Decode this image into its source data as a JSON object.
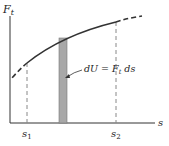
{
  "diagram": {
    "y_axis_label": "F",
    "y_axis_label_sub": "t",
    "x_axis_label": "s",
    "s1_label": "s",
    "s1_sub": "1",
    "s2_label": "s",
    "s2_sub": "2",
    "strip_label_main": "dU = F",
    "strip_label_sub": "t",
    "strip_label_tail": " ds",
    "colors": {
      "curve": "#333333",
      "strip": "#999999",
      "axis": "#333333"
    }
  }
}
